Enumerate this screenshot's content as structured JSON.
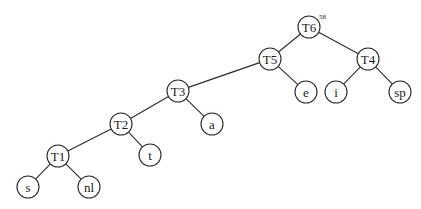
{
  "diagram": {
    "type": "binary-tree",
    "root_annotation": "58",
    "nodes": [
      {
        "id": "T6",
        "label": "T6",
        "x": 309,
        "y": 27
      },
      {
        "id": "T5",
        "label": "T5",
        "x": 270,
        "y": 59
      },
      {
        "id": "T4",
        "label": "T4",
        "x": 368,
        "y": 59
      },
      {
        "id": "e",
        "label": "e",
        "x": 306,
        "y": 92
      },
      {
        "id": "i",
        "label": "i",
        "x": 336,
        "y": 92
      },
      {
        "id": "sp",
        "label": "sp",
        "x": 400,
        "y": 92
      },
      {
        "id": "T3",
        "label": "T3",
        "x": 178,
        "y": 91
      },
      {
        "id": "a",
        "label": "a",
        "x": 212,
        "y": 124
      },
      {
        "id": "T2",
        "label": "T2",
        "x": 121,
        "y": 124
      },
      {
        "id": "t",
        "label": "t",
        "x": 150,
        "y": 155
      },
      {
        "id": "T1",
        "label": "T1",
        "x": 58,
        "y": 156
      },
      {
        "id": "s",
        "label": "s",
        "x": 28,
        "y": 187
      },
      {
        "id": "nl",
        "label": "nl",
        "x": 89,
        "y": 187
      }
    ],
    "edges": [
      [
        "T6",
        "T5"
      ],
      [
        "T6",
        "T4"
      ],
      [
        "T5",
        "T3"
      ],
      [
        "T5",
        "e"
      ],
      [
        "T4",
        "i"
      ],
      [
        "T4",
        "sp"
      ],
      [
        "T3",
        "T2"
      ],
      [
        "T3",
        "a"
      ],
      [
        "T2",
        "T1"
      ],
      [
        "T2",
        "t"
      ],
      [
        "T1",
        "s"
      ],
      [
        "T1",
        "nl"
      ]
    ]
  }
}
